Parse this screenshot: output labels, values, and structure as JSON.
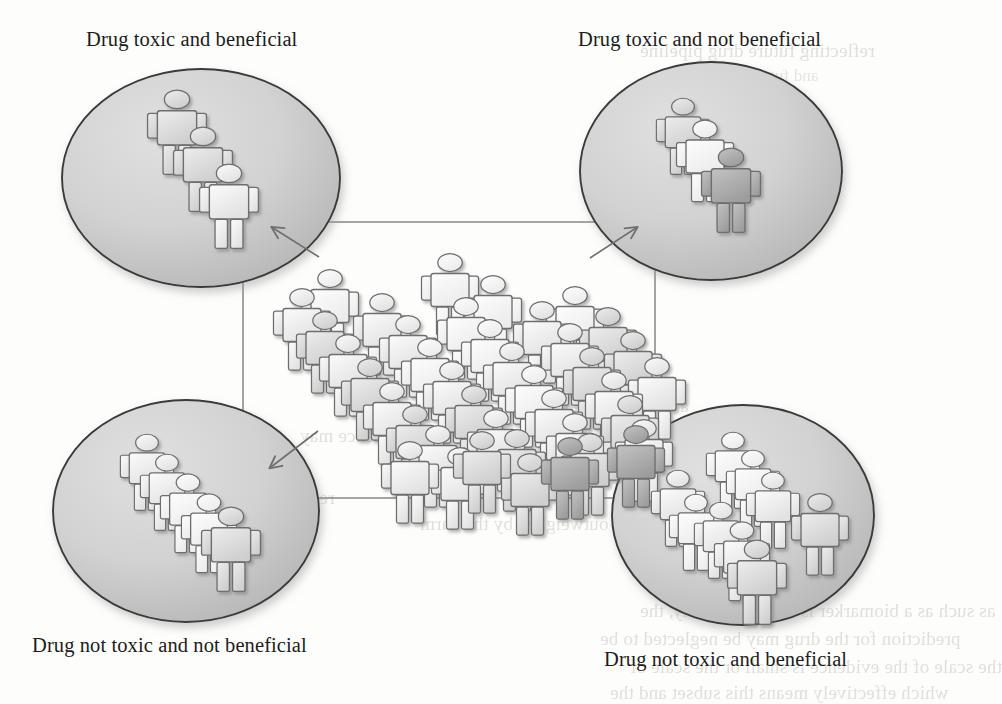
{
  "figure": {
    "title_present": false,
    "type": "concept-diagram",
    "colors": {
      "page_background": "#fdfdfb",
      "ellipse_fill_light": "#d8d8d8",
      "ellipse_fill_dark": "#b4b4b4",
      "ellipse_stroke": "#3a3a3a",
      "rectangle_stroke": "#8d8d8d",
      "arrow_stroke": "#6f6f6f",
      "figure_outline": "#6e6e6e",
      "figure_fill_light": "#f2f2f2",
      "figure_fill_mid": "#d5d5d5",
      "figure_fill_dark": "#9a9a9a",
      "label_text": "#1c1c1c",
      "bleed_text": "#c9c7c2"
    }
  },
  "labels": {
    "top_left": "Drug toxic and beneficial",
    "top_right": "Drug toxic and not beneficial",
    "bottom_left": "Drug not toxic and not beneficial",
    "bottom_right": "Drug not toxic and beneficial"
  },
  "groups": [
    {
      "id": "top-left",
      "label": "Drug toxic and beneficial",
      "person_count": 3,
      "arrangement": "diagonal-cascade",
      "arrow_direction": "up-left"
    },
    {
      "id": "top-right",
      "label": "Drug toxic and not beneficial",
      "person_count": 3,
      "arrangement": "diagonal-cascade",
      "arrow_direction": "up-right"
    },
    {
      "id": "bottom-left",
      "label": "Drug not toxic and not beneficial",
      "person_count": 5,
      "arrangement": "diagonal-cascade",
      "arrow_direction": "down-left"
    },
    {
      "id": "bottom-right",
      "label": "Drug not toxic and beneficial",
      "person_count": 9,
      "arrangement": "dense-cluster",
      "arrow_direction": "down-right"
    }
  ],
  "center": {
    "id": "population",
    "shape": "rectangle",
    "person_count": 40,
    "arrangement": "diagonal-rows"
  },
  "bleed_text": {
    "lines": [
      "lic health perspective, Phillips et al. describe",
      "ber that the benefit is outweighed by the harm",
      "dence might be too small or the evidence may",
      "a definitive trial or there was disagreement",
      "reflecting future drug pipeline",
      "and future drug pipeline",
      "as such as a biomarker is success. Finally, the",
      "prediction for the drug may be neglected to be",
      "the scale of the evidence is small or the scale of",
      "which effectively means this subset and the"
    ]
  }
}
